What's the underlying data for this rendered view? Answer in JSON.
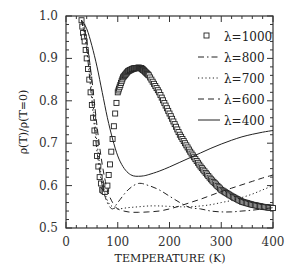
{
  "chart_data": {
    "type": "line",
    "title": "",
    "xlabel": "TEMPERATURE (K)",
    "ylabel": "ρ(T)/ρ(T=0)",
    "xlim": [
      0,
      400
    ],
    "ylim": [
      0.5,
      1.0
    ],
    "grid": false,
    "legend_position": "upper right",
    "x_ticks": [
      "0",
      "100",
      "200",
      "300",
      "400"
    ],
    "y_ticks": [
      "0.5",
      "0.6",
      "0.7",
      "0.8",
      "0.9",
      "1.0"
    ],
    "series": [
      {
        "name": "λ=1000",
        "style": "squares",
        "x": [
          30,
          33,
          36,
          40,
          45,
          50,
          55,
          60,
          65,
          70,
          75,
          80,
          85,
          90,
          95,
          100,
          110,
          120,
          130,
          140,
          145,
          150,
          160,
          180,
          200,
          220,
          240,
          260,
          280,
          300,
          320,
          340,
          360,
          380,
          400
        ],
        "y": [
          0.99,
          0.96,
          0.94,
          0.9,
          0.85,
          0.79,
          0.73,
          0.67,
          0.62,
          0.59,
          0.585,
          0.6,
          0.65,
          0.71,
          0.77,
          0.82,
          0.855,
          0.87,
          0.876,
          0.878,
          0.877,
          0.872,
          0.86,
          0.82,
          0.77,
          0.72,
          0.68,
          0.645,
          0.615,
          0.59,
          0.575,
          0.562,
          0.555,
          0.55,
          0.547
        ]
      },
      {
        "name": "λ=800",
        "style": "dash-dot",
        "x": [
          30,
          40,
          50,
          60,
          70,
          80,
          90,
          100,
          120,
          140,
          160,
          180,
          200,
          220,
          240,
          260,
          280,
          300,
          320,
          340,
          360,
          380,
          400
        ],
        "y": [
          0.99,
          0.92,
          0.8,
          0.68,
          0.6,
          0.56,
          0.545,
          0.56,
          0.59,
          0.605,
          0.6,
          0.59,
          0.575,
          0.56,
          0.548,
          0.545,
          0.54,
          0.538,
          0.538,
          0.54,
          0.542,
          0.545,
          0.548
        ]
      },
      {
        "name": "λ=700",
        "style": "dotted",
        "x": [
          30,
          40,
          50,
          60,
          70,
          80,
          90,
          100,
          120,
          140,
          160,
          180,
          200,
          220,
          240,
          260,
          280,
          300,
          320,
          340,
          360,
          380,
          400
        ],
        "y": [
          0.99,
          0.93,
          0.82,
          0.7,
          0.61,
          0.565,
          0.55,
          0.545,
          0.548,
          0.55,
          0.552,
          0.552,
          0.551,
          0.55,
          0.55,
          0.552,
          0.555,
          0.56,
          0.565,
          0.572,
          0.58,
          0.59,
          0.6
        ]
      },
      {
        "name": "λ=600",
        "style": "dashed",
        "x": [
          30,
          40,
          50,
          60,
          70,
          80,
          90,
          100,
          120,
          140,
          160,
          180,
          200,
          220,
          240,
          260,
          280,
          300,
          320,
          340,
          360,
          380,
          400
        ],
        "y": [
          0.99,
          0.94,
          0.85,
          0.74,
          0.65,
          0.59,
          0.56,
          0.545,
          0.538,
          0.537,
          0.538,
          0.54,
          0.545,
          0.552,
          0.56,
          0.568,
          0.577,
          0.586,
          0.594,
          0.602,
          0.61,
          0.618,
          0.625
        ]
      },
      {
        "name": "λ=400",
        "style": "solid",
        "x": [
          30,
          40,
          50,
          60,
          70,
          80,
          90,
          100,
          110,
          120,
          130,
          140,
          150,
          160,
          180,
          200,
          220,
          240,
          260,
          280,
          300,
          320,
          340,
          360,
          380,
          400
        ],
        "y": [
          0.99,
          0.97,
          0.93,
          0.88,
          0.82,
          0.76,
          0.71,
          0.67,
          0.645,
          0.63,
          0.623,
          0.622,
          0.623,
          0.626,
          0.634,
          0.644,
          0.655,
          0.666,
          0.677,
          0.688,
          0.698,
          0.707,
          0.715,
          0.721,
          0.726,
          0.73
        ]
      }
    ]
  },
  "legend": {
    "items": [
      {
        "label": "λ=1000",
        "style": "squares"
      },
      {
        "label": "λ=800",
        "style": "dash-dot"
      },
      {
        "label": "λ=700",
        "style": "dotted"
      },
      {
        "label": "λ=600",
        "style": "dashed"
      },
      {
        "label": "λ=400",
        "style": "solid"
      }
    ]
  },
  "colors": {
    "line": "#222222",
    "axis": "#333333",
    "background": "#ffffff"
  }
}
